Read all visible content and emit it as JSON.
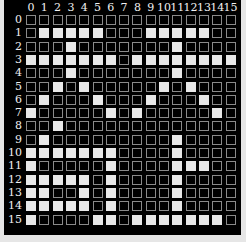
{
  "grid": {
    "rows": 16,
    "cols": 16,
    "col_labels": [
      "0",
      "1",
      "2",
      "3",
      "4",
      "5",
      "6",
      "7",
      "8",
      "9",
      "10",
      "11",
      "12",
      "13",
      "14",
      "15"
    ],
    "row_labels": [
      "0",
      "1",
      "2",
      "3",
      "4",
      "5",
      "6",
      "7",
      "8",
      "9",
      "10",
      "11",
      "12",
      "13",
      "14",
      "15"
    ],
    "filled": [
      [],
      [
        1,
        2,
        3,
        4,
        5,
        9,
        10,
        11,
        12,
        13
      ],
      [
        3,
        11
      ],
      [
        0,
        1,
        2,
        3,
        4,
        5,
        6,
        8,
        9,
        10,
        11,
        12,
        13,
        14,
        15
      ],
      [
        3,
        11
      ],
      [
        2,
        4,
        10,
        12
      ],
      [
        1,
        5,
        9,
        13
      ],
      [
        0,
        6,
        8,
        14
      ],
      [
        2
      ],
      [
        1,
        11
      ],
      [
        0,
        1,
        2,
        3,
        4,
        5,
        6,
        11
      ],
      [
        0,
        6,
        11,
        12,
        13
      ],
      [
        0,
        1,
        2,
        3,
        4,
        6,
        11
      ],
      [
        0,
        1,
        4,
        6,
        11
      ],
      [
        0,
        1,
        2,
        3,
        4,
        6,
        11
      ],
      [
        0,
        5,
        6,
        8,
        9,
        10,
        11,
        12,
        13,
        14
      ]
    ]
  },
  "colors": {
    "background": "#e6e6e6",
    "panel": "#000000",
    "filled_cell": "#e8e8e8",
    "empty_border": "#8a8a8a",
    "label": "#f0f0f0"
  }
}
